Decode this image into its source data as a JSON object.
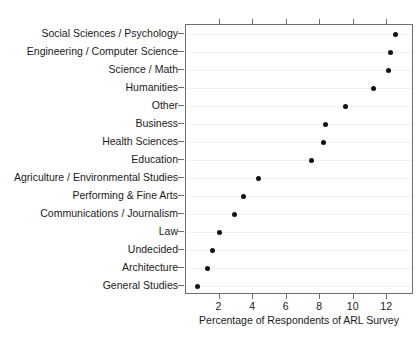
{
  "figure": {
    "clipped_title": "",
    "background_color": "#ffffff",
    "panel_border_color": "#6e6e6e",
    "point_color": "#111111",
    "gridline_color": "#f0f0f0"
  },
  "chart_data": {
    "type": "scatter",
    "title": "",
    "subtitle": "",
    "xlabel": "Percentage of Respondents of ARL Survey",
    "ylabel": "",
    "orientation": "horizontal",
    "style": "cleveland-dot-plot",
    "grid": true,
    "grid_axis": "y",
    "legend": false,
    "legend_position": "none",
    "xlim": [
      0.0,
      13.6
    ],
    "xticks": [
      2,
      4,
      6,
      8,
      10,
      12
    ],
    "xtick_labels": [
      "2",
      "4",
      "6",
      "8",
      "10",
      "12"
    ],
    "categories": [
      "Social Sciences / Psychology",
      "Engineering / Computer Science",
      "Science / Math",
      "Humanities",
      "Other",
      "Business",
      "Health Sciences",
      "Education",
      "Agriculture / Environmental Studies",
      "Performing & Fine Arts",
      "Communications / Journalism",
      "Law",
      "Undecided",
      "Architecture",
      "General Studies"
    ],
    "values": [
      12.5,
      12.2,
      12.1,
      11.2,
      9.5,
      8.3,
      8.2,
      7.5,
      4.3,
      3.4,
      2.9,
      2.0,
      1.6,
      1.3,
      0.7
    ],
    "points": [
      {
        "category": "Social Sciences / Psychology",
        "value": 12.5
      },
      {
        "category": "Engineering / Computer Science",
        "value": 12.2
      },
      {
        "category": "Science / Math",
        "value": 12.1
      },
      {
        "category": "Humanities",
        "value": 11.2
      },
      {
        "category": "Other",
        "value": 9.5
      },
      {
        "category": "Business",
        "value": 8.3
      },
      {
        "category": "Health Sciences",
        "value": 8.2
      },
      {
        "category": "Education",
        "value": 7.5
      },
      {
        "category": "Agriculture / Environmental Studies",
        "value": 4.3
      },
      {
        "category": "Performing & Fine Arts",
        "value": 3.4
      },
      {
        "category": "Communications / Journalism",
        "value": 2.9
      },
      {
        "category": "Law",
        "value": 2.0
      },
      {
        "category": "Undecided",
        "value": 1.6
      },
      {
        "category": "Architecture",
        "value": 1.3
      },
      {
        "category": "General Studies",
        "value": 0.7
      }
    ]
  }
}
